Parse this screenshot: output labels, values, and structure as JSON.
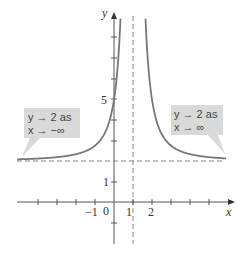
{
  "chart_data": {
    "type": "line",
    "title": "",
    "xlabel": "x",
    "ylabel": "y",
    "function_description": "y = 2 + 3/(x-1)^2",
    "xlim": [
      -5,
      6.4
    ],
    "ylim": [
      -2.3,
      9.4
    ],
    "x_tick_labels": [
      "-1",
      "0",
      "1",
      "2"
    ],
    "y_tick_labels": [
      "1",
      "5"
    ],
    "asymptotes": {
      "vertical": {
        "x": 1,
        "style": "dashed"
      },
      "horizontal": {
        "y": 2,
        "style": "dashed"
      }
    },
    "annotations": [
      {
        "line1": "y → 2 as",
        "line2": "x → −∞",
        "position": "left"
      },
      {
        "line1": "y → 2 as",
        "line2": "x → ∞",
        "position": "right"
      }
    ],
    "sample_points": [
      {
        "x": -4,
        "y": 2.12
      },
      {
        "x": -2,
        "y": 2.33
      },
      {
        "x": -1,
        "y": 2.75
      },
      {
        "x": 0,
        "y": 5
      },
      {
        "x": 2,
        "y": 5
      },
      {
        "x": 3,
        "y": 2.75
      },
      {
        "x": 4,
        "y": 2.33
      },
      {
        "x": 6,
        "y": 2.12
      }
    ],
    "curve_color": "#777777",
    "grid": false,
    "legend": "none"
  },
  "labels": {
    "x_axis": "x",
    "y_axis": "y",
    "tick_neg1": "−1",
    "tick_0": "0",
    "tick_1": "1",
    "tick_2": "2",
    "tick_y1": "1",
    "tick_y5": "5",
    "left_callout_line1": "y → 2 as",
    "left_callout_line2": "x → −∞",
    "right_callout_line1": "y → 2 as",
    "right_callout_line2": "x → ∞"
  }
}
